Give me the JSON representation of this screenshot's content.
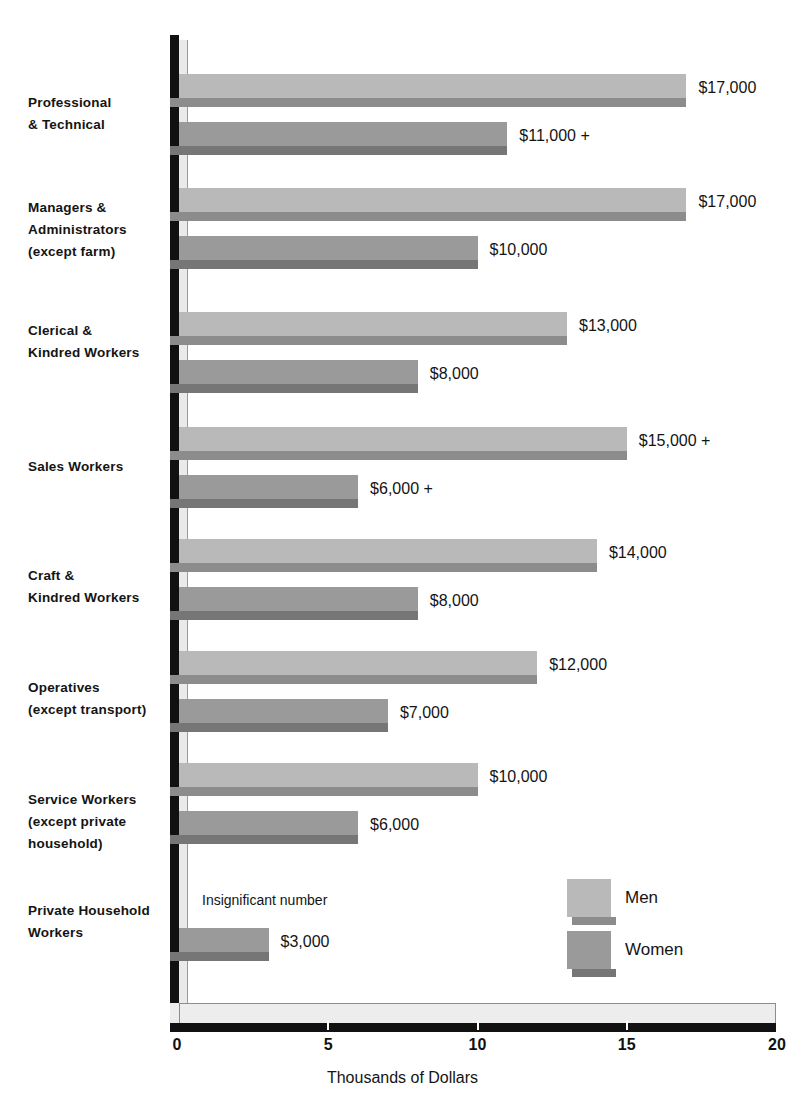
{
  "chart_data": {
    "type": "bar",
    "orientation": "horizontal",
    "title": "",
    "xlabel": "Thousands of Dollars",
    "ylabel": "",
    "xlim": [
      0,
      20
    ],
    "xticks": [
      0,
      5,
      10,
      15,
      20
    ],
    "xtick_labels": [
      "0",
      "5",
      "10",
      "15",
      "20"
    ],
    "grid": false,
    "legend_position": "lower-right",
    "categories": [
      "Professional\n& Technical",
      "Managers &\nAdministrators\n(except farm)",
      "Clerical &\nKindred Workers",
      "Sales Workers",
      "Craft &\nKindred Workers",
      "Operatives\n(except transport)",
      "Service Workers\n(except private\nhousehold)",
      "Private Household\nWorkers"
    ],
    "series": [
      {
        "name": "Men",
        "color": "#b9b9b9",
        "shadow_color": "#8c8c8c",
        "values": [
          17,
          17,
          13,
          15,
          14,
          12,
          10,
          null
        ],
        "labels": [
          "$17,000",
          "$17,000",
          "$13,000",
          "$15,000 +",
          "$14,000",
          "$12,000",
          "$10,000",
          "Insignificant number"
        ]
      },
      {
        "name": "Women",
        "color": "#9a9a9a",
        "shadow_color": "#767676",
        "values": [
          11,
          10,
          8,
          6,
          8,
          7,
          6,
          3
        ],
        "labels": [
          "$11,000 +",
          "$10,000",
          "$8,000",
          "$6,000 +",
          "$8,000",
          "$7,000",
          "$6,000",
          "$3,000"
        ]
      }
    ],
    "legend": [
      {
        "label": "Men",
        "color": "#b9b9b9"
      },
      {
        "label": "Women",
        "color": "#9a9a9a"
      }
    ],
    "notes": [
      "Insignificant number"
    ]
  },
  "axis": {
    "x_title": "Thousands of Dollars",
    "ticks": [
      "0",
      "5",
      "10",
      "15",
      "20"
    ]
  },
  "legend": {
    "men": "Men",
    "women": "Women"
  },
  "notes": {
    "insignificant": "Insignificant number"
  },
  "categories": {
    "c0": "Professional\n& Technical",
    "c1": "Managers &\nAdministrators\n(except farm)",
    "c2": "Clerical &\nKindred Workers",
    "c3": "Sales Workers",
    "c4": "Craft &\nKindred Workers",
    "c5": "Operatives\n(except transport)",
    "c6": "Service Workers\n(except private\nhousehold)",
    "c7": "Private Household\nWorkers"
  },
  "values": {
    "v0m": "$17,000",
    "v0w": "$11,000 +",
    "v1m": "$17,000",
    "v1w": "$10,000",
    "v2m": "$13,000",
    "v2w": "$8,000",
    "v3m": "$15,000 +",
    "v3w": "$6,000 +",
    "v4m": "$14,000",
    "v4w": "$8,000",
    "v5m": "$12,000",
    "v5w": "$7,000",
    "v6m": "$10,000",
    "v6w": "$6,000",
    "v7w": "$3,000"
  }
}
